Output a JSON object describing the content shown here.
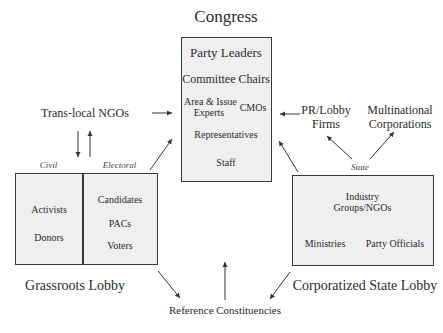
{
  "congress": {
    "title": "Congress",
    "members": {
      "party_leaders": "Party Leaders",
      "committee_chairs": "Committee Chairs",
      "area_issue_experts_line1": "Area & Issue",
      "area_issue_experts_line2": "Experts",
      "cmos": "CMOs",
      "representatives": "Representatives",
      "staff": "Staff"
    }
  },
  "grassroots_lobby": {
    "title": "Grassroots Lobby",
    "civil_label": "Civil",
    "electoral_label": "Electoral",
    "civil_items": [
      "Activists",
      "Donors"
    ],
    "electoral_items": [
      "Candidates",
      "PACs",
      "Voters"
    ]
  },
  "corporatized_state_lobby": {
    "title": "Corporatized State Lobby",
    "state_label": "State",
    "industry_line1": "Industry",
    "industry_line2": "Groups/NGOs",
    "ministries": "Ministries",
    "party_officials": "Party Officials"
  },
  "external_actors": {
    "translocal_ngos": "Trans-local NGOs",
    "pr_lobby_line1": "PR/Lobby",
    "pr_lobby_line2": "Firms",
    "multinational_line1": "Multinational",
    "multinational_line2": "Corporations"
  },
  "reference_constituencies": "Reference Constituencies",
  "colors": {
    "box_fill": "#efefef",
    "box_border": "#3a3a3a",
    "arrow": "#333333",
    "text": "#2b2b2b"
  }
}
